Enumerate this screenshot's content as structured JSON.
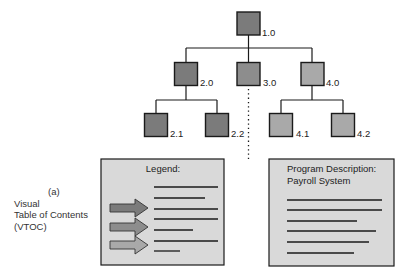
{
  "colors": {
    "level1_fill": "#7b7b7b",
    "module3_fill": "#8d8d8d",
    "module4_fill": "#a9a9a9",
    "panel_fill": "#d9d9d9",
    "line": "#1a1a1a",
    "arrow_dark": "#7b7b7b",
    "arrow_mid": "#8d8d8d",
    "arrow_light": "#a9a9a9"
  },
  "tree": {
    "nodes": [
      {
        "id": "1.0",
        "label": "1.0"
      },
      {
        "id": "2.0",
        "label": "2.0"
      },
      {
        "id": "3.0",
        "label": "3.0"
      },
      {
        "id": "4.0",
        "label": "4.0"
      },
      {
        "id": "2.1",
        "label": "2.1"
      },
      {
        "id": "2.2",
        "label": "2.2"
      },
      {
        "id": "4.1",
        "label": "4.1"
      },
      {
        "id": "4.2",
        "label": "4.2"
      }
    ]
  },
  "side_caption": {
    "marker": "(a)",
    "lines": [
      "Visual",
      "Table of Contents",
      "(VTOC)"
    ]
  },
  "legend_panel": {
    "title": "Legend:",
    "arrow_count": 3,
    "line_count": 7
  },
  "program_panel": {
    "title_line1": "Program Description:",
    "title_line2": "Payroll System",
    "line_count": 6
  }
}
